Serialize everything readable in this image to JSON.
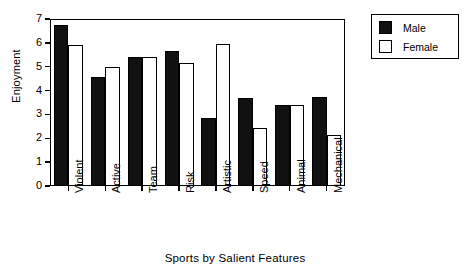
{
  "chart_data": {
    "type": "bar",
    "title": "",
    "xlabel": "Sports by Salient Features",
    "ylabel": "Enjoyment",
    "categories": [
      "Violent",
      "Active",
      "Team",
      "Risk",
      "Artistic",
      "Speed",
      "Animal",
      "Mechanical"
    ],
    "series": [
      {
        "name": "Male",
        "color": "#111111",
        "values": [
          6.75,
          4.55,
          5.4,
          5.65,
          2.85,
          3.7,
          3.4,
          3.75
        ]
      },
      {
        "name": "Female",
        "color": "#ffffff",
        "values": [
          5.9,
          4.98,
          5.4,
          5.15,
          5.95,
          2.42,
          3.4,
          2.15
        ]
      }
    ],
    "ylim": [
      0,
      7
    ],
    "yticks": [
      0,
      1,
      2,
      3,
      4,
      5,
      6,
      7
    ],
    "ytick_labels": [
      "0",
      "1",
      "2",
      "3",
      "4",
      "5",
      "6",
      "7"
    ],
    "grid": false,
    "legend_position": "outside-top-right",
    "frame": true
  },
  "legend": {
    "entries": [
      {
        "label": "Male",
        "swatch": "filled-black-square"
      },
      {
        "label": "Female",
        "swatch": "open-white-square"
      }
    ]
  },
  "axes": {
    "y_title": "Enjoyment",
    "x_title": "Sports by Salient Features"
  }
}
